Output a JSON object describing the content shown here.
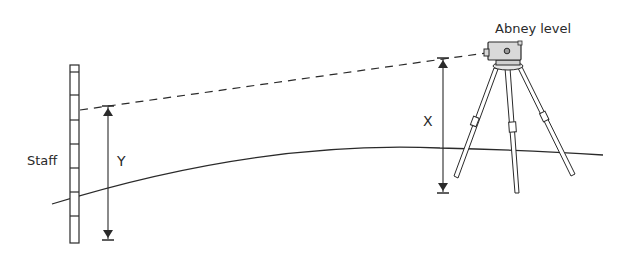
{
  "diagram": {
    "type": "surveying-illustration",
    "labels": {
      "instrument": "Abney level",
      "staff": "Staff",
      "instrument_height": "X",
      "staff_height": "Y"
    },
    "colors": {
      "line": "#2a2a2a",
      "instrument_fill": "#d9d9d9",
      "background": "#ffffff"
    },
    "elements": [
      {
        "id": "staff",
        "label": "Staff",
        "graduations": 8
      },
      {
        "id": "abney-level",
        "label": "Abney level",
        "mounted_on": "tripod"
      },
      {
        "id": "tripod",
        "legs": 3
      },
      {
        "id": "sight-line",
        "style": "dashed",
        "from": "abney-level",
        "to": "staff"
      },
      {
        "id": "ground",
        "style": "curved"
      },
      {
        "id": "dimension-x",
        "label": "X",
        "meaning": "height of instrument above ground"
      },
      {
        "id": "dimension-y",
        "label": "Y",
        "meaning": "staff reading from sight line to ground"
      }
    ]
  }
}
